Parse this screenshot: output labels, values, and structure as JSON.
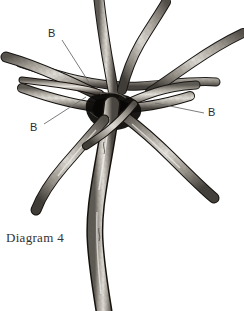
{
  "figure": {
    "title": "Diagram 4",
    "caption": "Diagram 4",
    "style": "black and white engraving line art",
    "colors": {
      "background": "#ffffff",
      "outline": "#1a1a1a",
      "wood_light": "#d9d6d0",
      "wood_mid": "#9a958c",
      "wood_dark": "#4a4641",
      "shadow": "#111111",
      "leader_line": "#6e6e6e",
      "label_text": "#2b2b2b",
      "caption_text": "#333333"
    },
    "labels": [
      {
        "id": "b-top",
        "text": "B",
        "x": 48,
        "y": 28,
        "leader": {
          "x1": 62,
          "y1": 40,
          "x2": 90,
          "y2": 84
        }
      },
      {
        "id": "b-left",
        "text": "B",
        "x": 30,
        "y": 122,
        "leader": {
          "x1": 44,
          "y1": 124,
          "x2": 86,
          "y2": 97
        }
      },
      {
        "id": "b-right",
        "text": "B",
        "x": 208,
        "y": 107,
        "leader": {
          "x1": 204,
          "y1": 113,
          "x2": 155,
          "y2": 103
        }
      }
    ],
    "elements": {
      "trunk": "main vertical trunk descending from center knot to bottom edge",
      "knot": "dark central weave where branches cross",
      "branch_count": 9,
      "branches": [
        "upper-left vertical shoot",
        "upper-middle rising shoot",
        "upper-right angled shoot",
        "left horizontal branch to left edge",
        "right horizontal branch to right edge",
        "ring branch front",
        "ring branch back",
        "lower-left descending branch",
        "lower-right descending branch"
      ]
    }
  }
}
